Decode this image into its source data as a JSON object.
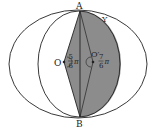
{
  "diagram": {
    "points": {
      "A": {
        "label": "A"
      },
      "B": {
        "label": "B"
      },
      "O": {
        "label": "O"
      },
      "O_prime": {
        "label": "O′"
      },
      "Y": {
        "label": "Y"
      }
    },
    "angles": {
      "at_O": {
        "numerator": "5",
        "denominator": "6",
        "symbol": "π"
      },
      "at_O_prime": {
        "numerator": "7",
        "denominator": "6",
        "symbol": "π"
      }
    },
    "colors": {
      "stroke": "#222222",
      "shade": "#8c8c8c",
      "background": "#ffffff"
    }
  }
}
